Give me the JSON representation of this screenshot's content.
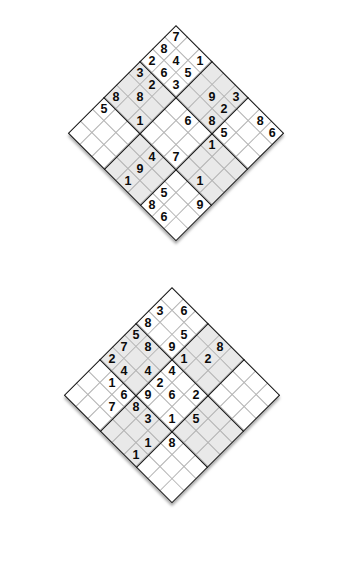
{
  "puzzle": {
    "title": "Twodoku / Butterfly Sudoku",
    "type": "overlapping-sudoku",
    "orientation": "diamond (rotated 45 degrees)",
    "grid_count": 2,
    "grid_size": 9,
    "box_size": 3,
    "shared_region": "one 3x3 box shared between the two grids",
    "colors": {
      "page_background": "#ffffff",
      "cell_background": "#ffffff",
      "shaded_box_background": "#e9e9e9",
      "thin_grid_line": "#b2b2b2",
      "thick_grid_line": "#141414",
      "digit_color": "#0b0b0b"
    },
    "grids": [
      {
        "name": "upper-grid",
        "position": {
          "left": 176,
          "top": 25
        },
        "size_px": 153,
        "shaded_boxes": [
          [
            0,
            1
          ],
          [
            1,
            0
          ],
          [
            1,
            2
          ],
          [
            2,
            1
          ]
        ],
        "givens": [
          {
            "r": 0,
            "c": 0,
            "v": "7"
          },
          {
            "r": 1,
            "c": 0,
            "v": "8"
          },
          {
            "r": 2,
            "c": 0,
            "v": "2"
          },
          {
            "r": 1,
            "c": 1,
            "v": "4"
          },
          {
            "r": 0,
            "c": 2,
            "v": "1"
          },
          {
            "r": 2,
            "c": 1,
            "v": "6"
          },
          {
            "r": 1,
            "c": 2,
            "v": "5"
          },
          {
            "r": 3,
            "c": 0,
            "v": "3"
          },
          {
            "r": 2,
            "c": 2,
            "v": "3"
          },
          {
            "r": 0,
            "c": 5,
            "v": "3"
          },
          {
            "r": 3,
            "c": 1,
            "v": "2"
          },
          {
            "r": 1,
            "c": 4,
            "v": "9"
          },
          {
            "r": 1,
            "c": 5,
            "v": "2"
          },
          {
            "r": 0,
            "c": 7,
            "v": "8"
          },
          {
            "r": 5,
            "c": 0,
            "v": "8"
          },
          {
            "r": 4,
            "c": 1,
            "v": "8"
          },
          {
            "r": 2,
            "c": 5,
            "v": "8"
          },
          {
            "r": 6,
            "c": 0,
            "v": "5"
          },
          {
            "r": 3,
            "c": 4,
            "v": "6"
          },
          {
            "r": 2,
            "c": 6,
            "v": "5"
          },
          {
            "r": 0,
            "c": 8,
            "v": "6"
          },
          {
            "r": 5,
            "c": 2,
            "v": "1"
          },
          {
            "r": 3,
            "c": 6,
            "v": "1"
          },
          {
            "r": 6,
            "c": 4,
            "v": "4"
          },
          {
            "r": 5,
            "c": 5,
            "v": "7"
          },
          {
            "r": 7,
            "c": 4,
            "v": "9"
          },
          {
            "r": 5,
            "c": 7,
            "v": "1"
          },
          {
            "r": 8,
            "c": 4,
            "v": "1"
          },
          {
            "r": 7,
            "c": 6,
            "v": "5"
          },
          {
            "r": 6,
            "c": 8,
            "v": "9"
          },
          {
            "r": 8,
            "c": 6,
            "v": "8"
          },
          {
            "r": 8,
            "c": 7,
            "v": "6"
          }
        ]
      },
      {
        "name": "lower-grid",
        "position": {
          "left": 172,
          "top": 287
        },
        "size_px": 153,
        "shaded_boxes": [
          [
            0,
            1
          ],
          [
            1,
            0
          ],
          [
            1,
            2
          ],
          [
            2,
            1
          ]
        ],
        "givens": [
          {
            "r": 0,
            "c": 1,
            "v": "6"
          },
          {
            "r": 1,
            "c": 0,
            "v": "3"
          },
          {
            "r": 2,
            "c": 0,
            "v": "8"
          },
          {
            "r": 1,
            "c": 2,
            "v": "5"
          },
          {
            "r": 0,
            "c": 4,
            "v": "8"
          },
          {
            "r": 3,
            "c": 0,
            "v": "5"
          },
          {
            "r": 2,
            "c": 2,
            "v": "9"
          },
          {
            "r": 3,
            "c": 1,
            "v": "8"
          },
          {
            "r": 1,
            "c": 4,
            "v": "2"
          },
          {
            "r": 4,
            "c": 0,
            "v": "7"
          },
          {
            "r": 2,
            "c": 3,
            "v": "1"
          },
          {
            "r": 5,
            "c": 0,
            "v": "2"
          },
          {
            "r": 4,
            "c": 2,
            "v": "4"
          },
          {
            "r": 3,
            "c": 3,
            "v": "4"
          },
          {
            "r": 3,
            "c": 5,
            "v": "2"
          },
          {
            "r": 5,
            "c": 1,
            "v": "4"
          },
          {
            "r": 4,
            "c": 3,
            "v": "2"
          },
          {
            "r": 4,
            "c": 4,
            "v": "6"
          },
          {
            "r": 6,
            "c": 1,
            "v": "1"
          },
          {
            "r": 5,
            "c": 3,
            "v": "9"
          },
          {
            "r": 6,
            "c": 2,
            "v": "6"
          },
          {
            "r": 5,
            "c": 5,
            "v": "1"
          },
          {
            "r": 4,
            "c": 6,
            "v": "5"
          },
          {
            "r": 7,
            "c": 2,
            "v": "7"
          },
          {
            "r": 6,
            "c": 3,
            "v": "8"
          },
          {
            "r": 6,
            "c": 4,
            "v": "3"
          },
          {
            "r": 6,
            "c": 6,
            "v": "8"
          },
          {
            "r": 7,
            "c": 5,
            "v": "1"
          },
          {
            "r": 8,
            "c": 5,
            "v": "1"
          }
        ]
      }
    ]
  }
}
